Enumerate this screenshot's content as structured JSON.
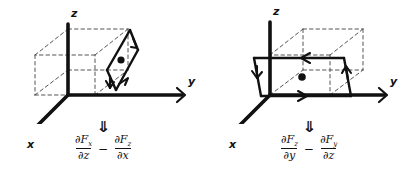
{
  "figure": {
    "title": "Curl components as circulation loops",
    "background_color": "#ffffff",
    "ink_color": "#111111",
    "dash_color": "#555555"
  },
  "panels": [
    {
      "id": "left",
      "name": "curl-y-component-panel",
      "axes": {
        "z_label": "z",
        "y_label": "y",
        "x_label": "x"
      },
      "loop": {
        "plane": "x-z",
        "style": "solid-parallelogram",
        "center_dot": "●",
        "arrow_count": 2
      },
      "box": {
        "style": "dashed",
        "label": "dashed-cube"
      },
      "double_arrow": "⇓",
      "formula": {
        "term1": {
          "numerator_partial": "∂",
          "numerator_var": "F",
          "numerator_sub": "x",
          "denominator_partial": "∂",
          "denominator_var": "z"
        },
        "operator": "−",
        "term2": {
          "numerator_partial": "∂",
          "numerator_var": "F",
          "numerator_sub": "z",
          "denominator_partial": "∂",
          "denominator_var": "x"
        },
        "plain_text": "∂Fx/∂z − ∂Fz/∂x"
      }
    },
    {
      "id": "right",
      "name": "curl-x-component-panel",
      "axes": {
        "z_label": "z",
        "y_label": "y",
        "x_label": "x"
      },
      "loop": {
        "plane": "y-z",
        "style": "solid-parallelogram",
        "center_dot": "●",
        "arrow_count": 4
      },
      "box": {
        "style": "dashed",
        "label": "dashed-cube"
      },
      "double_arrow": "⇓",
      "formula": {
        "term1": {
          "numerator_partial": "∂",
          "numerator_var": "F",
          "numerator_sub": "z",
          "denominator_partial": "∂",
          "denominator_var": "y"
        },
        "operator": "−",
        "term2": {
          "numerator_partial": "∂",
          "numerator_var": "F",
          "numerator_sub": "y",
          "denominator_partial": "∂",
          "denominator_var": "z"
        },
        "plain_text": "∂Fz/∂y − ∂Fy/∂z"
      }
    }
  ]
}
